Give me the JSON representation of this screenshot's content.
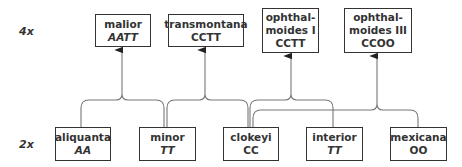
{
  "level_labels": {
    "tetraploid": "4x",
    "diploid": "2x"
  },
  "tetraploids": [
    {
      "name": "malior",
      "genome": "AATT",
      "genome_italic": true
    },
    {
      "name": "transmontana",
      "genome": "CCTT",
      "genome_italic": false
    },
    {
      "name_line1": "ophthal-",
      "name_line2": "moides I",
      "genome": "CCTT",
      "genome_italic": false
    },
    {
      "name_line1": "ophthal-",
      "name_line2": "moides III",
      "genome": "CCOO",
      "genome_italic": false
    }
  ],
  "diploids": [
    {
      "name": "aliquanta",
      "genome": "AA",
      "genome_italic": true
    },
    {
      "name": "minor",
      "genome": "TT",
      "genome_italic": true
    },
    {
      "name": "clokeyi",
      "genome": "CC",
      "genome_italic": false
    },
    {
      "name": "interior",
      "genome": "TT",
      "genome_italic": true
    },
    {
      "name": "mexicana",
      "genome": "OO",
      "genome_italic": false
    }
  ],
  "colors": {
    "line": "#777777",
    "box_border": "#333333",
    "text": "#333333"
  }
}
